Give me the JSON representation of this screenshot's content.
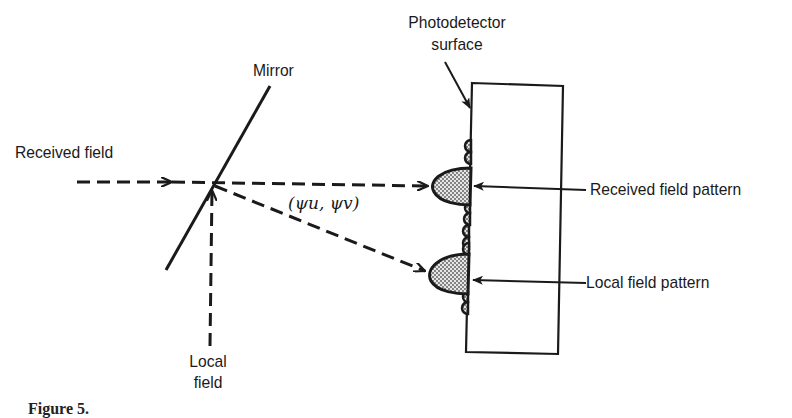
{
  "diagram": {
    "labels": {
      "received_field": "Received field",
      "mirror": "Mirror",
      "local_field_line1": "Local",
      "local_field_line2": "field",
      "photodetector_line1": "Photodetector",
      "photodetector_line2": "surface",
      "angle": "(ψu, ψv)",
      "received_field_pattern": "Received field pattern",
      "local_field_pattern": "Local field pattern"
    },
    "caption_partial": "Figure 5.",
    "colors": {
      "ink": "#1a1a1a",
      "background": "#ffffff",
      "lobe_fill": "#bdbdbd"
    },
    "elements": {
      "mirror": {
        "x1": 270,
        "y1": 86,
        "x2": 166,
        "y2": 270
      },
      "received_beam": {
        "x1": 77,
        "y1": 182,
        "x2": 430,
        "y2": 186
      },
      "local_beam": {
        "x1": 210,
        "y1": 345,
        "x2": 212,
        "y2": 188
      },
      "reflected_beam": {
        "x1": 214,
        "y1": 185,
        "x2": 425,
        "y2": 270
      },
      "detector_rect": {
        "points": "472,83 563,86 558,354 466,352"
      }
    }
  }
}
